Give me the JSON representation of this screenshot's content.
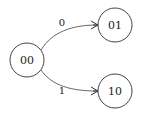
{
  "diagram": {
    "type": "state-transition",
    "nodes": [
      {
        "id": "n00",
        "label": "00",
        "cx": 27,
        "cy": 60,
        "r": 17
      },
      {
        "id": "n01",
        "label": "01",
        "cx": 115,
        "cy": 25,
        "r": 17
      },
      {
        "id": "n10",
        "label": "10",
        "cx": 115,
        "cy": 91,
        "r": 17
      }
    ],
    "edges": [
      {
        "from": "00",
        "to": "01",
        "label": "0"
      },
      {
        "from": "00",
        "to": "10",
        "label": "1"
      }
    ],
    "colors": {
      "node_stroke": "#444444",
      "edge_stroke": "#555555",
      "text": "#222222",
      "background": "#ffffff"
    }
  }
}
